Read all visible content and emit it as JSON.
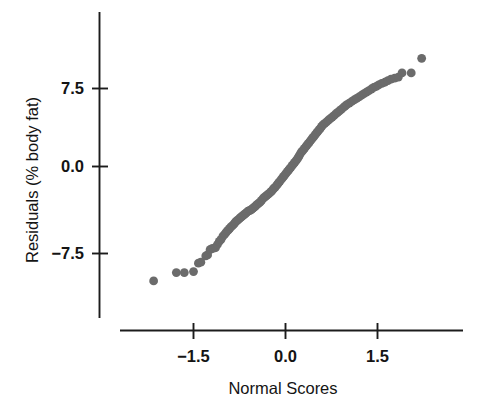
{
  "chart_data": {
    "type": "scatter",
    "title": "",
    "subtitle": "",
    "xlabel": "Normal Scores",
    "ylabel": "Residuals (% body fat)",
    "xlim": [
      -2.3,
      2.3
    ],
    "ylim": [
      -12.5,
      11.0
    ],
    "xticks": [
      -1.5,
      0.0,
      1.5
    ],
    "xticklabels": [
      "−1.5",
      "0.0",
      "1.5"
    ],
    "yticks": [
      -7.5,
      0.0,
      7.5
    ],
    "yticklabels": [
      "−7.5",
      "0.0",
      "7.5"
    ],
    "grid": false,
    "legend": null,
    "legend_position": "none",
    "marker": "circle",
    "marker_color": "#6b6b6b",
    "marker_size_px": 4.4,
    "axis_color": "#1c1c1c",
    "background_color": "#ffffff",
    "annotations": [],
    "series": [
      {
        "name": "Residuals vs Normal Scores",
        "color": "#6b6b6b",
        "points": [
          [
            -2.15,
            -11.0
          ],
          [
            -1.78,
            -10.2
          ],
          [
            -1.65,
            -10.2
          ],
          [
            -1.5,
            -10.1
          ],
          [
            -1.42,
            -9.3
          ],
          [
            -1.38,
            -9.2
          ],
          [
            -1.3,
            -8.6
          ],
          [
            -1.27,
            -8.5
          ],
          [
            -1.23,
            -8.0
          ],
          [
            -1.2,
            -7.9
          ],
          [
            -1.17,
            -7.85
          ],
          [
            -1.14,
            -7.8
          ],
          [
            -1.11,
            -7.5
          ],
          [
            -1.08,
            -7.2
          ],
          [
            -1.05,
            -7.0
          ],
          [
            -1.02,
            -6.7
          ],
          [
            -0.99,
            -6.5
          ],
          [
            -0.97,
            -6.35
          ],
          [
            -0.95,
            -6.2
          ],
          [
            -0.93,
            -6.1
          ],
          [
            -0.91,
            -5.95
          ],
          [
            -0.89,
            -5.8
          ],
          [
            -0.87,
            -5.7
          ],
          [
            -0.85,
            -5.6
          ],
          [
            -0.83,
            -5.45
          ],
          [
            -0.81,
            -5.3
          ],
          [
            -0.79,
            -5.2
          ],
          [
            -0.77,
            -5.1
          ],
          [
            -0.75,
            -5.0
          ],
          [
            -0.73,
            -4.9
          ],
          [
            -0.71,
            -4.8
          ],
          [
            -0.69,
            -4.7
          ],
          [
            -0.67,
            -4.6
          ],
          [
            -0.65,
            -4.5
          ],
          [
            -0.63,
            -4.4
          ],
          [
            -0.61,
            -4.3
          ],
          [
            -0.59,
            -4.25
          ],
          [
            -0.57,
            -4.2
          ],
          [
            -0.55,
            -4.1
          ],
          [
            -0.53,
            -4.0
          ],
          [
            -0.51,
            -3.9
          ],
          [
            -0.49,
            -3.8
          ],
          [
            -0.47,
            -3.7
          ],
          [
            -0.45,
            -3.6
          ],
          [
            -0.43,
            -3.5
          ],
          [
            -0.41,
            -3.4
          ],
          [
            -0.39,
            -3.25
          ],
          [
            -0.37,
            -3.1
          ],
          [
            -0.35,
            -3.0
          ],
          [
            -0.33,
            -2.9
          ],
          [
            -0.31,
            -2.8
          ],
          [
            -0.29,
            -2.7
          ],
          [
            -0.27,
            -2.6
          ],
          [
            -0.25,
            -2.5
          ],
          [
            -0.23,
            -2.4
          ],
          [
            -0.21,
            -2.25
          ],
          [
            -0.19,
            -2.1
          ],
          [
            -0.17,
            -2.0
          ],
          [
            -0.15,
            -1.85
          ],
          [
            -0.13,
            -1.7
          ],
          [
            -0.11,
            -1.55
          ],
          [
            -0.09,
            -1.4
          ],
          [
            -0.07,
            -1.25
          ],
          [
            -0.05,
            -1.1
          ],
          [
            -0.03,
            -0.95
          ],
          [
            -0.01,
            -0.8
          ],
          [
            0.01,
            -0.65
          ],
          [
            0.03,
            -0.5
          ],
          [
            0.05,
            -0.35
          ],
          [
            0.07,
            -0.2
          ],
          [
            0.09,
            -0.05
          ],
          [
            0.11,
            0.1
          ],
          [
            0.13,
            0.25
          ],
          [
            0.15,
            0.4
          ],
          [
            0.17,
            0.55
          ],
          [
            0.19,
            0.7
          ],
          [
            0.21,
            0.9
          ],
          [
            0.23,
            1.1
          ],
          [
            0.25,
            1.3
          ],
          [
            0.27,
            1.45
          ],
          [
            0.29,
            1.6
          ],
          [
            0.31,
            1.75
          ],
          [
            0.33,
            1.9
          ],
          [
            0.35,
            2.05
          ],
          [
            0.37,
            2.2
          ],
          [
            0.39,
            2.35
          ],
          [
            0.41,
            2.5
          ],
          [
            0.43,
            2.65
          ],
          [
            0.45,
            2.8
          ],
          [
            0.47,
            2.95
          ],
          [
            0.49,
            3.1
          ],
          [
            0.51,
            3.25
          ],
          [
            0.53,
            3.4
          ],
          [
            0.55,
            3.55
          ],
          [
            0.57,
            3.7
          ],
          [
            0.59,
            3.85
          ],
          [
            0.61,
            4.0
          ],
          [
            0.64,
            4.15
          ],
          [
            0.67,
            4.3
          ],
          [
            0.7,
            4.45
          ],
          [
            0.73,
            4.6
          ],
          [
            0.76,
            4.75
          ],
          [
            0.79,
            4.9
          ],
          [
            0.82,
            5.05
          ],
          [
            0.85,
            5.2
          ],
          [
            0.88,
            5.35
          ],
          [
            0.91,
            5.5
          ],
          [
            0.94,
            5.65
          ],
          [
            0.97,
            5.8
          ],
          [
            1.0,
            5.95
          ],
          [
            1.04,
            6.1
          ],
          [
            1.08,
            6.25
          ],
          [
            1.12,
            6.4
          ],
          [
            1.16,
            6.55
          ],
          [
            1.2,
            6.7
          ],
          [
            1.24,
            6.85
          ],
          [
            1.28,
            7.0
          ],
          [
            1.32,
            7.15
          ],
          [
            1.36,
            7.3
          ],
          [
            1.4,
            7.45
          ],
          [
            1.44,
            7.6
          ],
          [
            1.48,
            7.7
          ],
          [
            1.52,
            7.85
          ],
          [
            1.57,
            8.0
          ],
          [
            1.62,
            8.1
          ],
          [
            1.67,
            8.25
          ],
          [
            1.72,
            8.4
          ],
          [
            1.78,
            8.5
          ],
          [
            1.84,
            8.6
          ],
          [
            1.9,
            9.0
          ],
          [
            2.05,
            9.0
          ],
          [
            2.22,
            10.4
          ]
        ]
      }
    ]
  },
  "axes": {
    "x_title": "Normal Scores",
    "y_title": "Residuals (% body fat)",
    "x_tick_labels": [
      "−1.5",
      "0.0",
      "1.5"
    ],
    "y_tick_labels": [
      "7.5",
      "0.0",
      "−7.5"
    ]
  }
}
